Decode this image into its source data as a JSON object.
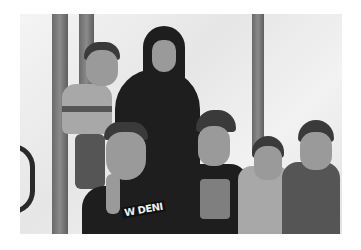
{
  "image": {
    "description": "Black-and-white photograph of a woman in a dark hijab and abaya standing in front of a white tarp with dark vertical stripes, surrounded by five young boys; she holds a toddler on her right, and the boy in front gives a thumbs-up.",
    "colors": {
      "background": "#ffffff",
      "tarp": "#eeeeee",
      "stripe": "#6a6a6a",
      "clothing_dark": "#1e1e1e"
    },
    "visible_text": {
      "front_boy_shirt": "W DENI"
    },
    "subjects": [
      {
        "role": "woman",
        "position": "center-left",
        "clothing": "black hijab and abaya"
      },
      {
        "role": "toddler",
        "position": "left, held by woman",
        "clothing": "striped polo"
      },
      {
        "role": "boy-thumbs-up",
        "position": "front-left",
        "clothing": "dark t-shirt with text"
      },
      {
        "role": "boy",
        "position": "center",
        "clothing": "dark t-shirt with graphic"
      },
      {
        "role": "boy",
        "position": "right-center",
        "clothing": "light collared shirt"
      },
      {
        "role": "boy",
        "position": "far right",
        "clothing": "patterned shirt"
      }
    ]
  }
}
